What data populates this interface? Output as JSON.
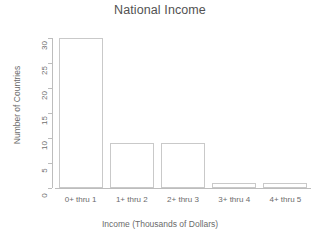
{
  "chart_data": {
    "type": "bar",
    "title": "National Income",
    "xlabel": "Income (Thousands of Dollars)",
    "ylabel": "Number of Countries",
    "categories": [
      "0+ thru 1",
      "1+ thru 2",
      "2+ thru 3",
      "3+ thru 4",
      "4+ thru 5"
    ],
    "values": [
      30,
      9,
      9,
      1,
      1
    ],
    "ylim": [
      0,
      30
    ],
    "yticks": [
      0,
      5,
      10,
      15,
      20,
      25,
      30
    ],
    "ytick_labels": [
      "0",
      "5",
      "10",
      "15",
      "20",
      "25",
      "30"
    ],
    "grid": false,
    "legend": false,
    "bar_fill_color": "#ffffff",
    "bar_border_color": "#c9c9c9",
    "axis_color": "#bdbdbd",
    "text_color": "#6b6b6b",
    "background_color": "#ffffff"
  }
}
